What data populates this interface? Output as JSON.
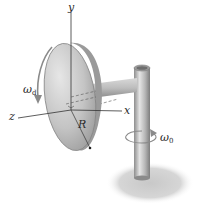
{
  "diagram": {
    "labels": {
      "y_axis": "y",
      "z_axis": "z",
      "x_axis": "x",
      "radius": "R",
      "omega_disk": "ω",
      "omega_disk_sub": "d",
      "omega_post": "ω",
      "omega_post_sub": "0"
    },
    "colors": {
      "disk_face_light": "#d8d8d8",
      "disk_face_dark": "#a9a9a9",
      "disk_rim": "#8c8c8c",
      "shaft_light": "#e0e0e0",
      "shaft_dark": "#8a8a8a",
      "shadow": "#cfcfcf",
      "axis_line": "#333333",
      "background": "#ffffff"
    }
  }
}
